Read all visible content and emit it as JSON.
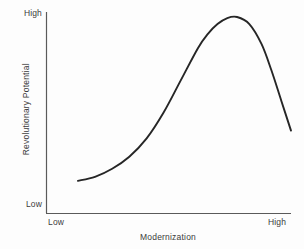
{
  "chart_data": {
    "type": "line",
    "title": "",
    "subtitle": "",
    "xlabel": "Modernization",
    "ylabel": "Revolutionary Potential",
    "x_tick_labels": [
      "Low",
      "High"
    ],
    "y_tick_labels": [
      "Low",
      "High"
    ],
    "xlim": [
      0,
      1
    ],
    "ylim": [
      0,
      1
    ],
    "grid": false,
    "legend": null,
    "annotations": [],
    "line_color": "#262626",
    "axis_color": "#5a5a5a",
    "background_color": "#fdfdfd",
    "series": [
      {
        "name": "Revolutionary potential vs modernization",
        "x": [
          0.13,
          0.2,
          0.27,
          0.34,
          0.41,
          0.48,
          0.55,
          0.62,
          0.66,
          0.7,
          0.74,
          0.78,
          0.83,
          0.88,
          0.92,
          0.96,
          1.0
        ],
        "y": [
          0.16,
          0.18,
          0.22,
          0.28,
          0.37,
          0.5,
          0.66,
          0.82,
          0.89,
          0.94,
          0.97,
          0.975,
          0.94,
          0.84,
          0.71,
          0.56,
          0.41
        ]
      }
    ]
  },
  "axes": {
    "y_top_label": "High",
    "y_bottom_label": "Low",
    "x_left_label": "Low",
    "x_right_label": "High",
    "y_title": "Revolutionary Potential",
    "x_title": "Modernization"
  }
}
